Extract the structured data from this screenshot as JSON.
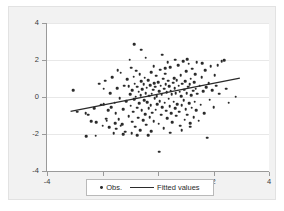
{
  "chart_data": {
    "type": "scatter",
    "title": "",
    "xlabel": "",
    "ylabel": "",
    "xlim": [
      -4,
      4
    ],
    "ylim": [
      -4,
      4
    ],
    "xticks": [
      -4,
      -2,
      0,
      2,
      4
    ],
    "yticks": [
      -4,
      -2,
      0,
      2,
      4
    ],
    "xtick_labels": [
      "-4",
      "-2",
      "0",
      "2",
      "4"
    ],
    "ytick_labels": [
      "-4",
      "-2",
      "0",
      "2",
      "4"
    ],
    "grid": "horizontal",
    "legend_position": "below-plot",
    "marker_color": "#2b2b2b",
    "line_color": "#2b2b2b",
    "plot_background": "#ffffff",
    "panel_background": "#f2f2f2",
    "series": [
      {
        "name": "Obs.",
        "type": "scatter",
        "points": [
          [
            -3.05,
            0.36
          ],
          [
            -2.92,
            -0.79
          ],
          [
            -2.58,
            -2.12
          ],
          [
            -2.52,
            -0.95
          ],
          [
            -2.4,
            -1.3
          ],
          [
            -2.3,
            -0.62
          ],
          [
            -2.22,
            -1.37
          ],
          [
            -2.12,
            0.72
          ],
          [
            -2.05,
            -0.42
          ],
          [
            -2.0,
            -1.55
          ],
          [
            -1.96,
            -0.38
          ],
          [
            -1.9,
            0.88
          ],
          [
            -1.86,
            -1.18
          ],
          [
            -1.8,
            -0.7
          ],
          [
            -1.76,
            -1.62
          ],
          [
            -1.72,
            0.2
          ],
          [
            -1.68,
            -0.55
          ],
          [
            -1.64,
            1.06
          ],
          [
            -1.6,
            -1.95
          ],
          [
            -1.56,
            -0.3
          ],
          [
            -1.52,
            -0.88
          ],
          [
            -1.5,
            -1.72
          ],
          [
            -1.46,
            0.48
          ],
          [
            -1.42,
            -1.2
          ],
          [
            -1.38,
            -0.05
          ],
          [
            -1.34,
            1.32
          ],
          [
            -1.3,
            -1.46
          ],
          [
            -1.26,
            -0.66
          ],
          [
            -1.22,
            0.62
          ],
          [
            -1.18,
            -1.88
          ],
          [
            -1.14,
            -0.22
          ],
          [
            -1.1,
            0.95
          ],
          [
            -1.06,
            -1.05
          ],
          [
            -1.02,
            2.01
          ],
          [
            -1.0,
            0.15
          ],
          [
            -0.98,
            -0.48
          ],
          [
            -0.96,
            1.58
          ],
          [
            -0.94,
            -1.34
          ],
          [
            -0.92,
            0.38
          ],
          [
            -0.9,
            -0.8
          ],
          [
            -0.88,
            1.1
          ],
          [
            -0.86,
            -0.12
          ],
          [
            -0.84,
            0.72
          ],
          [
            -0.82,
            -1.6
          ],
          [
            -0.8,
            0.02
          ],
          [
            -0.78,
            1.42
          ],
          [
            -0.76,
            -0.58
          ],
          [
            -0.74,
            0.55
          ],
          [
            -0.72,
            -1.12
          ],
          [
            -0.7,
            0.28
          ],
          [
            -0.68,
            -0.35
          ],
          [
            -0.66,
            1.22
          ],
          [
            -0.64,
            -1.78
          ],
          [
            -0.62,
            0.1
          ],
          [
            -0.6,
            0.85
          ],
          [
            -0.58,
            -0.7
          ],
          [
            -0.56,
            0.42
          ],
          [
            -0.54,
            -1.25
          ],
          [
            -0.52,
            0.68
          ],
          [
            -0.5,
            -0.18
          ],
          [
            -0.48,
            1.05
          ],
          [
            -0.46,
            -0.92
          ],
          [
            -0.44,
            0.22
          ],
          [
            -0.42,
            -1.5
          ],
          [
            -0.4,
            0.5
          ],
          [
            -0.38,
            -0.28
          ],
          [
            -0.36,
            0.92
          ],
          [
            -0.34,
            -0.62
          ],
          [
            -0.32,
            0.08
          ],
          [
            -0.3,
            -1.08
          ],
          [
            -0.28,
            0.65
          ],
          [
            -0.26,
            -0.45
          ],
          [
            -0.24,
            1.35
          ],
          [
            -0.22,
            0.18
          ],
          [
            -0.2,
            -0.85
          ],
          [
            -0.18,
            0.4
          ],
          [
            -0.16,
            -1.3
          ],
          [
            -0.14,
            0.75
          ],
          [
            -0.12,
            -0.08
          ],
          [
            -0.1,
            0.55
          ],
          [
            -0.08,
            -0.68
          ],
          [
            -0.06,
            1.15
          ],
          [
            -0.04,
            0.05
          ],
          [
            -0.02,
            -0.4
          ],
          [
            0.0,
            0.8
          ],
          [
            0.02,
            -1.45
          ],
          [
            0.04,
            0.32
          ],
          [
            0.06,
            -0.22
          ],
          [
            0.08,
            1.48
          ],
          [
            0.1,
            0.6
          ],
          [
            0.12,
            -0.95
          ],
          [
            0.14,
            0.12
          ],
          [
            0.16,
            -0.55
          ],
          [
            0.18,
            0.98
          ],
          [
            0.2,
            -1.7
          ],
          [
            0.22,
            0.45
          ],
          [
            0.24,
            -0.3
          ],
          [
            0.26,
            1.25
          ],
          [
            0.28,
            0.7
          ],
          [
            0.3,
            -0.75
          ],
          [
            0.32,
            0.25
          ],
          [
            0.34,
            -1.15
          ],
          [
            0.36,
            0.88
          ],
          [
            0.38,
            -0.1
          ],
          [
            0.4,
            0.58
          ],
          [
            0.42,
            -0.5
          ],
          [
            0.44,
            1.62
          ],
          [
            0.46,
            0.35
          ],
          [
            0.48,
            -0.88
          ],
          [
            0.5,
            0.15
          ],
          [
            0.52,
            -1.35
          ],
          [
            0.54,
            0.78
          ],
          [
            0.56,
            -0.25
          ],
          [
            0.58,
            1.02
          ],
          [
            0.6,
            0.48
          ],
          [
            0.62,
            -0.62
          ],
          [
            0.64,
            0.2
          ],
          [
            0.66,
            -1.02
          ],
          [
            0.68,
            0.92
          ],
          [
            0.7,
            -0.38
          ],
          [
            0.72,
            1.72
          ],
          [
            0.74,
            0.62
          ],
          [
            0.76,
            -0.8
          ],
          [
            0.78,
            0.28
          ],
          [
            0.8,
            -1.55
          ],
          [
            0.82,
            1.18
          ],
          [
            0.84,
            0.05
          ],
          [
            0.86,
            -0.45
          ],
          [
            0.88,
            0.72
          ],
          [
            0.9,
            1.95
          ],
          [
            0.92,
            -0.18
          ],
          [
            0.94,
            0.4
          ],
          [
            0.96,
            -1.22
          ],
          [
            0.98,
            0.85
          ],
          [
            1.0,
            -0.65
          ],
          [
            1.02,
            1.38
          ],
          [
            1.04,
            0.22
          ],
          [
            1.06,
            -0.95
          ],
          [
            1.08,
            0.55
          ],
          [
            1.1,
            1.8
          ],
          [
            1.12,
            -0.32
          ],
          [
            1.14,
            0.68
          ],
          [
            1.16,
            -1.42
          ],
          [
            1.18,
            0.98
          ],
          [
            1.2,
            0.1
          ],
          [
            1.22,
            -0.58
          ],
          [
            1.24,
            1.52
          ],
          [
            1.26,
            0.35
          ],
          [
            1.28,
            -1.08
          ],
          [
            1.3,
            0.8
          ],
          [
            1.32,
            -0.25
          ],
          [
            1.34,
            1.22
          ],
          [
            1.36,
            0.45
          ],
          [
            1.38,
            -0.72
          ],
          [
            1.4,
            1.88
          ],
          [
            1.42,
            0.18
          ],
          [
            1.46,
            -1.28
          ],
          [
            1.5,
            0.62
          ],
          [
            1.54,
            -0.42
          ],
          [
            1.58,
            1.08
          ],
          [
            1.62,
            0.3
          ],
          [
            1.66,
            -0.88
          ],
          [
            1.7,
            1.45
          ],
          [
            1.74,
            0.52
          ],
          [
            1.78,
            -2.2
          ],
          [
            1.82,
            0.75
          ],
          [
            1.86,
            -0.15
          ],
          [
            1.9,
            1.65
          ],
          [
            1.95,
            0.38
          ],
          [
            2.0,
            -0.55
          ],
          [
            2.05,
            1.18
          ],
          [
            2.1,
            0.62
          ],
          [
            2.2,
            0.18
          ],
          [
            2.3,
            1.92
          ],
          [
            2.38,
            1.98
          ],
          [
            2.45,
            0.45
          ],
          [
            2.55,
            -0.3
          ],
          [
            2.8,
            0.02
          ],
          [
            -0.85,
            2.85
          ],
          [
            -0.6,
            2.55
          ],
          [
            -0.45,
            2.12
          ],
          [
            0.15,
            2.28
          ],
          [
            0.35,
            1.88
          ],
          [
            0.05,
            -2.95
          ],
          [
            -0.35,
            -2.05
          ],
          [
            -0.75,
            -2.08
          ],
          [
            -1.25,
            -2.02
          ],
          [
            -2.25,
            -2.1
          ],
          [
            0.62,
            2.02
          ],
          [
            1.05,
            2.05
          ],
          [
            -1.45,
            1.45
          ],
          [
            -1.95,
            0.45
          ],
          [
            -1.55,
            -1.42
          ],
          [
            -1.35,
            -1.55
          ],
          [
            -0.95,
            -1.95
          ],
          [
            -0.25,
            -1.85
          ],
          [
            0.45,
            -1.92
          ],
          [
            0.85,
            -1.78
          ],
          [
            1.15,
            -1.6
          ],
          [
            -0.15,
            1.68
          ],
          [
            0.25,
            1.55
          ],
          [
            -1.05,
            0.58
          ],
          [
            1.6,
            1.82
          ],
          [
            2.15,
            1.72
          ],
          [
            -2.6,
            -0.88
          ],
          [
            -1.85,
            -1.28
          ]
        ]
      },
      {
        "name": "Fitted values",
        "type": "line",
        "x_start": -3.15,
        "y_start": -0.78,
        "x_end": 2.95,
        "y_end": 1.02
      }
    ],
    "legend": [
      {
        "label": "Obs.",
        "marker": "dot"
      },
      {
        "label": "Fitted values",
        "marker": "line"
      }
    ]
  }
}
